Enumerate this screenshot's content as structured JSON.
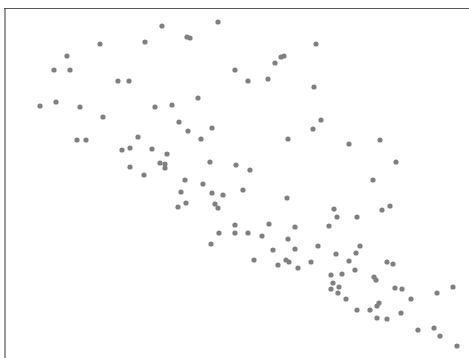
{
  "chart_data": {
    "type": "scatter",
    "title": "",
    "xlabel": "",
    "ylabel": "",
    "grid": false,
    "legend": null,
    "marker_color": "#808080",
    "marker_radius": 2.6,
    "frame": {
      "left": 5,
      "top": 8,
      "right": 469,
      "bottom": 358,
      "color": "#555555"
    },
    "note": "Point coordinates are in pixel space (no axis ticks visible). Downward trend from upper-left to lower-right.",
    "points": [
      [
        100,
        44
      ],
      [
        67,
        56
      ],
      [
        54,
        70
      ],
      [
        70,
        70
      ],
      [
        118,
        81
      ],
      [
        129,
        81
      ],
      [
        40,
        106
      ],
      [
        56,
        102
      ],
      [
        80,
        107
      ],
      [
        162,
        26
      ],
      [
        218,
        22
      ],
      [
        145,
        42
      ],
      [
        187,
        37
      ],
      [
        190,
        38
      ],
      [
        235,
        70
      ],
      [
        248,
        81
      ],
      [
        198,
        98
      ],
      [
        172,
        105
      ],
      [
        155,
        107
      ],
      [
        316,
        44
      ],
      [
        281,
        57
      ],
      [
        284,
        56
      ],
      [
        275,
        63
      ],
      [
        268,
        79
      ],
      [
        314,
        87
      ],
      [
        321,
        120
      ],
      [
        313,
        129
      ],
      [
        103,
        117
      ],
      [
        77,
        140
      ],
      [
        86,
        140
      ],
      [
        138,
        137
      ],
      [
        122,
        150
      ],
      [
        130,
        148
      ],
      [
        152,
        149
      ],
      [
        167,
        154
      ],
      [
        130,
        167
      ],
      [
        160,
        163
      ],
      [
        165,
        164
      ],
      [
        165,
        168
      ],
      [
        144,
        175
      ],
      [
        179,
        122
      ],
      [
        188,
        131
      ],
      [
        212,
        128
      ],
      [
        201,
        139
      ],
      [
        288,
        139
      ],
      [
        210,
        162
      ],
      [
        236,
        165
      ],
      [
        250,
        170
      ],
      [
        185,
        180
      ],
      [
        203,
        184
      ],
      [
        181,
        192
      ],
      [
        212,
        193
      ],
      [
        223,
        195
      ],
      [
        243,
        190
      ],
      [
        287,
        198
      ],
      [
        178,
        207
      ],
      [
        186,
        203
      ],
      [
        215,
        204
      ],
      [
        218,
        208
      ],
      [
        235,
        225
      ],
      [
        219,
        233
      ],
      [
        235,
        233
      ],
      [
        248,
        233
      ],
      [
        269,
        224
      ],
      [
        262,
        236
      ],
      [
        288,
        239
      ],
      [
        211,
        244
      ],
      [
        273,
        250
      ],
      [
        295,
        249
      ],
      [
        254,
        260
      ],
      [
        278,
        265
      ],
      [
        286,
        260
      ],
      [
        289,
        262
      ],
      [
        298,
        268
      ],
      [
        349,
        144
      ],
      [
        380,
        140
      ],
      [
        396,
        162
      ],
      [
        373,
        180
      ],
      [
        334,
        209
      ],
      [
        337,
        217
      ],
      [
        357,
        217
      ],
      [
        382,
        210
      ],
      [
        390,
        206
      ],
      [
        295,
        227
      ],
      [
        329,
        226
      ],
      [
        318,
        246
      ],
      [
        360,
        246
      ],
      [
        356,
        253
      ],
      [
        336,
        254
      ],
      [
        311,
        262
      ],
      [
        349,
        261
      ],
      [
        387,
        262
      ],
      [
        393,
        264
      ],
      [
        331,
        275
      ],
      [
        342,
        274
      ],
      [
        355,
        270
      ],
      [
        374,
        277
      ],
      [
        376,
        280
      ],
      [
        333,
        283
      ],
      [
        331,
        289
      ],
      [
        339,
        287
      ],
      [
        338,
        293
      ],
      [
        346,
        299
      ],
      [
        395,
        288
      ],
      [
        402,
        289
      ],
      [
        411,
        299
      ],
      [
        437,
        293
      ],
      [
        453,
        287
      ],
      [
        357,
        310
      ],
      [
        370,
        310
      ],
      [
        379,
        303
      ],
      [
        377,
        306
      ],
      [
        377,
        318
      ],
      [
        387,
        319
      ],
      [
        401,
        313
      ],
      [
        418,
        330
      ],
      [
        434,
        328
      ],
      [
        440,
        336
      ],
      [
        457,
        346
      ]
    ]
  }
}
